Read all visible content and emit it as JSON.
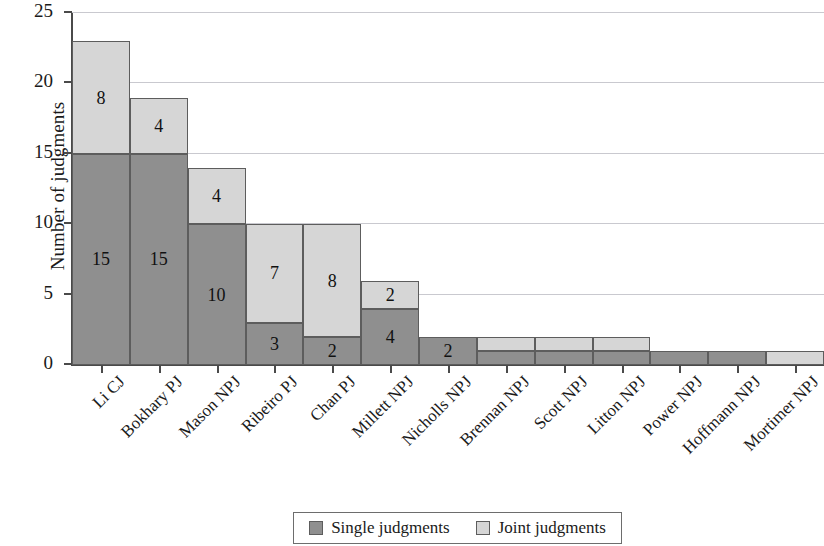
{
  "chart_data": {
    "type": "bar",
    "subtype": "stacked-vertical",
    "title": "",
    "xlabel": "",
    "ylabel": "Number of judgments",
    "ylim": [
      0,
      25
    ],
    "yticks": [
      0,
      5,
      10,
      15,
      20,
      25
    ],
    "ytick_labels": [
      "0",
      "5",
      "10",
      "15",
      "20",
      "25"
    ],
    "grid": "horizontal",
    "legend_position": "bottom-center",
    "categories": [
      "Li CJ",
      "Bokhary PJ",
      "Mason NPJ",
      "Ribeiro PJ",
      "Chan PJ",
      "Millett NPJ",
      "Nicholls NPJ",
      "Brennan NPJ",
      "Scott NPJ",
      "Litton NPJ",
      "Power NPJ",
      "Hoffmann NPJ",
      "Mortimer NPJ"
    ],
    "series": [
      {
        "name": "Single judgments",
        "color": "#8f8f8f",
        "values": [
          15,
          15,
          10,
          3,
          2,
          4,
          2,
          1,
          1,
          1,
          1,
          1,
          0
        ]
      },
      {
        "name": "Joint judgments",
        "color": "#d6d6d6",
        "values": [
          8,
          4,
          4,
          7,
          8,
          2,
          0,
          1,
          1,
          1,
          0,
          0,
          1
        ]
      }
    ],
    "totals": [
      23,
      19,
      14,
      10,
      10,
      6,
      2,
      2,
      2,
      2,
      1,
      1,
      1
    ],
    "bar_value_labels": {
      "single": [
        "15",
        "15",
        "10",
        "3",
        "2",
        "4",
        "2",
        "",
        "",
        "",
        "",
        "",
        ""
      ],
      "joint": [
        "8",
        "4",
        "4",
        "7",
        "8",
        "2",
        "",
        "",
        "",
        "",
        "",
        "",
        ""
      ]
    }
  },
  "legend": {
    "entries": [
      {
        "label": "Single judgments",
        "swatch": "#8f8f8f"
      },
      {
        "label": "Joint judgments",
        "swatch": "#d6d6d6"
      }
    ]
  },
  "axes": {
    "y_title": "Number of judgments"
  },
  "colors": {
    "single": "#8f8f8f",
    "joint": "#d6d6d6",
    "axis": "#4a4a4a",
    "grid": "#c9c9cf",
    "bar_outline": "#5d5d5d",
    "background": "#ffffff"
  }
}
